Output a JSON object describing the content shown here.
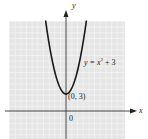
{
  "chart_data": {
    "type": "line",
    "title": "",
    "xlabel": "x",
    "ylabel": "y",
    "equation_label": "y = x² + 3",
    "vertex_label": "(0, 3)",
    "origin_label": "0",
    "function": "y = x^2 + 3",
    "vertex": [
      0,
      3
    ],
    "x": [
      -3.5,
      -3,
      -2,
      -1,
      0,
      1,
      2,
      3,
      3.5
    ],
    "series": [
      {
        "name": "y = x^2 + 3",
        "values": [
          15.25,
          12,
          7,
          4,
          3,
          4,
          7,
          12,
          15.25
        ]
      }
    ],
    "xlim": [
      -10,
      10
    ],
    "ylim": [
      -5,
      16
    ],
    "grid": true,
    "legend": "none"
  },
  "labels": {
    "y_axis": "y",
    "x_axis": "x",
    "equation": "y = x",
    "equation_exp": "2",
    "equation_tail": " + 3",
    "vertex": "(0, 3)",
    "origin": "0"
  },
  "colors": {
    "grid_bg": "#e9e9e9",
    "grid_line": "#ffffff",
    "curve": "#1a1a1a",
    "axis": "#333333"
  }
}
